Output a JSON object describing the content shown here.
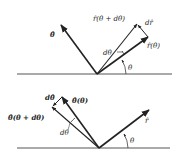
{
  "figure": {
    "top_panel": {
      "labels": {
        "theta_hat": "θ̂",
        "r_hat_theta_plus_dtheta": "r̂(θ + dθ)",
        "d_r_hat": "dr̂",
        "r_hat_theta": "r̂(θ)",
        "d_theta": "dθ",
        "theta": "θ"
      }
    },
    "bottom_panel": {
      "labels": {
        "d_theta_hat": "dθ̂",
        "theta_hat_theta": "θ̂(θ)",
        "theta_hat_theta_plus_dtheta": "θ̂(θ + dθ)",
        "d_theta": "dθ",
        "r_hat": "r̂",
        "theta": "θ"
      }
    },
    "colors": {
      "ink": "#222222",
      "line": "#555555",
      "background": "#ffffff"
    }
  }
}
